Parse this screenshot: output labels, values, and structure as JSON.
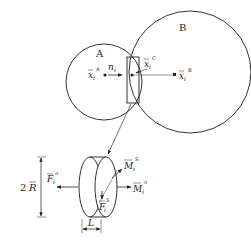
{
  "diagram": {
    "spheres": [
      {
        "id": "A",
        "label": "A"
      },
      {
        "id": "B",
        "label": "B"
      }
    ],
    "points": {
      "center_A": {
        "base": "x",
        "sub": "i",
        "sup": "A"
      },
      "center_B": {
        "base": "x",
        "sub": "i",
        "sup": "B"
      },
      "contact_C": {
        "base": "x",
        "sub": "i",
        "sup": "C"
      }
    },
    "normal": {
      "base": "n",
      "sub": "i"
    },
    "disc_labels": {
      "diameter": "2",
      "radius_symbol": "R",
      "normal_force": {
        "base": "F",
        "sub": "i",
        "sup": "n"
      },
      "shear_force": {
        "base": "F",
        "sub": "i",
        "sup": "S"
      },
      "normal_moment": {
        "base": "M",
        "sub": "i",
        "sup": "n"
      },
      "shear_moment": {
        "base": "M",
        "sub": "i",
        "sup": "S"
      },
      "length": "L"
    }
  }
}
